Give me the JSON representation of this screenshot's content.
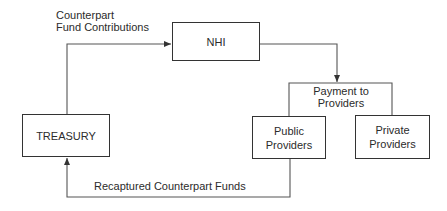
{
  "diagram": {
    "nodes": {
      "nhi": {
        "label": "NHI"
      },
      "treasury": {
        "label": "TREASURY"
      },
      "public_providers": {
        "line1": "Public",
        "line2": "Providers"
      },
      "private_providers": {
        "line1": "Private",
        "line2": "Providers"
      }
    },
    "edges": {
      "counterpart_contributions": {
        "line1": "Counterpart",
        "line2": "Fund Contributions"
      },
      "payment_to_providers": {
        "line1": "Payment to",
        "line2": "Providers"
      },
      "recaptured_funds": {
        "label": "Recaptured Counterpart Funds"
      }
    },
    "colors": {
      "line": "#444444",
      "text": "#2b2b2b",
      "background": "#ffffff"
    }
  }
}
